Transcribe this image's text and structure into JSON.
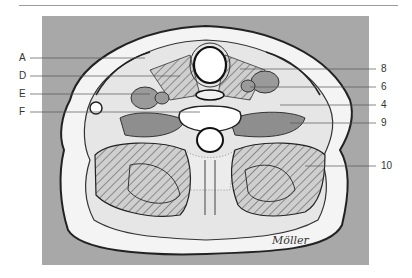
{
  "figure": {
    "background_color": "#a8a8a8",
    "signature": "Möller"
  },
  "labels_left": [
    {
      "text": "A",
      "y": 58
    },
    {
      "text": "D",
      "y": 76
    },
    {
      "text": "E",
      "y": 94
    },
    {
      "text": "F",
      "y": 112
    }
  ],
  "labels_right": [
    {
      "text": "8",
      "y": 69
    },
    {
      "text": "6",
      "y": 87
    },
    {
      "text": "4",
      "y": 105
    },
    {
      "text": "9",
      "y": 123
    },
    {
      "text": "10",
      "y": 166
    }
  ]
}
